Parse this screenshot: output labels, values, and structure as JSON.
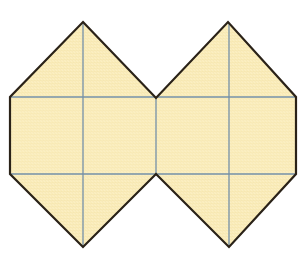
{
  "figure": {
    "title": "Net of two square pyramids joined at a common face",
    "background_color": "#ffffff",
    "width": 305,
    "height": 258
  },
  "style": {
    "fill_color": "#faedbe",
    "fill_color_light": "#fdf4d4",
    "outline_color": "#2a2218",
    "outline_width": 2.2,
    "fold_line_color": "#6e8ca8",
    "fold_line_width": 1.3,
    "paper_texture_color": "#f2e2ae"
  },
  "geometry": {
    "vertices": {
      "left_top_apex": [
        83,
        22
      ],
      "left_upper_left": [
        10,
        97
      ],
      "left_lower_left": [
        10,
        174
      ],
      "left_bottom_apex": [
        83,
        247
      ],
      "center_top_valley": [
        156,
        98
      ],
      "center_bottom_valley": [
        156,
        174
      ],
      "right_top_apex": [
        228,
        22
      ],
      "right_upper_right": [
        296,
        97
      ],
      "right_lower_right": [
        296,
        174
      ],
      "right_bottom_apex": [
        229,
        247
      ]
    },
    "outline_path": "M 83 22 L 156 98 L 228 22 L 296 97 L 296 174 L 229 247 L 156 174 L 83 247 L 10 174 L 10 97 Z",
    "fold_lines": [
      {
        "name": "upper-horizontal-fold",
        "x1": 10,
        "y1": 97,
        "x2": 296,
        "y2": 97
      },
      {
        "name": "lower-horizontal-fold",
        "x1": 10,
        "y1": 174,
        "x2": 296,
        "y2": 174
      },
      {
        "name": "left-vertical-fold",
        "x1": 83,
        "y1": 23,
        "x2": 83,
        "y2": 246
      },
      {
        "name": "center-vertical-fold",
        "x1": 156,
        "y1": 98,
        "x2": 156,
        "y2": 174
      },
      {
        "name": "right-vertical-fold",
        "x1": 229,
        "y1": 23,
        "x2": 229,
        "y2": 246
      }
    ],
    "faces": [
      {
        "name": "left-upper-left-triangle",
        "points": "10,97 83,22 83,97"
      },
      {
        "name": "left-upper-right-triangle",
        "points": "83,22 156,98 83,97"
      },
      {
        "name": "left-square-upper-left",
        "points": "10,97 83,97 83,136 10,136"
      },
      {
        "name": "left-square-upper-right",
        "points": "83,97 156,98 156,136 83,136"
      },
      {
        "name": "left-square-lower-left",
        "points": "10,136 83,136 83,174 10,174"
      },
      {
        "name": "left-square-lower-right",
        "points": "83,136 156,136 156,174 83,174"
      },
      {
        "name": "left-lower-left-triangle",
        "points": "10,174 83,174 83,247"
      },
      {
        "name": "left-lower-right-triangle",
        "points": "83,174 156,174 83,247"
      },
      {
        "name": "right-upper-left-triangle",
        "points": "156,98 228,22 229,98"
      },
      {
        "name": "right-upper-right-triangle",
        "points": "228,22 296,97 229,98"
      },
      {
        "name": "right-square-upper-left",
        "points": "156,98 229,98 229,136 156,136"
      },
      {
        "name": "right-square-upper-right",
        "points": "229,98 296,97 296,136 229,136"
      },
      {
        "name": "right-square-lower-left",
        "points": "156,136 229,136 229,174 156,174"
      },
      {
        "name": "right-square-lower-right",
        "points": "229,136 296,136 296,174 229,174"
      },
      {
        "name": "right-lower-left-triangle",
        "points": "156,174 229,174 229,247"
      },
      {
        "name": "right-lower-right-triangle",
        "points": "229,174 296,174 229,247"
      }
    ]
  }
}
